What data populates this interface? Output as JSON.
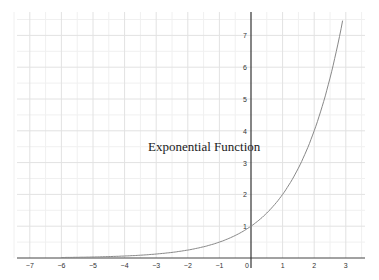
{
  "chart_data": {
    "type": "line",
    "title": "Exponential Function",
    "xlabel": "",
    "ylabel": "",
    "function": "y = 2^x",
    "xlim": [
      -7.5,
      3.6
    ],
    "ylim": [
      0,
      7.6
    ],
    "grid": true,
    "x_ticks": [
      "−7",
      "−6",
      "−5",
      "−4",
      "−3",
      "−2",
      "−1",
      "0",
      "1",
      "2",
      "3"
    ],
    "y_ticks": [
      "1",
      "2",
      "3",
      "4",
      "5",
      "6",
      "7"
    ],
    "series": [
      {
        "name": "Exponential Function",
        "x": [
          -7,
          -6,
          -5,
          -4,
          -3,
          -2,
          -1,
          0,
          1,
          2,
          2.5,
          2.93
        ],
        "y": [
          0.0078,
          0.0156,
          0.031,
          0.0625,
          0.125,
          0.25,
          0.5,
          1,
          2,
          4,
          5.66,
          7.6
        ],
        "color": "#888888"
      }
    ]
  }
}
